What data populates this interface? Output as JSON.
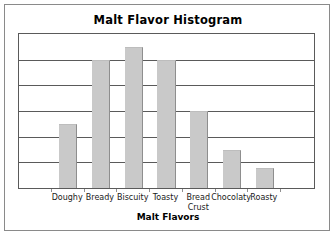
{
  "chart_data": {
    "type": "bar",
    "title": "Malt Flavor Histogram",
    "xlabel": "Malt Flavors",
    "ylabel": "",
    "categories": [
      "Doughy",
      "Bready",
      "Biscuity",
      "Toasty",
      "Bread Crust",
      "Chocolaty",
      "Roasty"
    ],
    "values": [
      2.5,
      5.0,
      5.5,
      5.0,
      3.0,
      1.5,
      0.77
    ],
    "ylim": [
      0,
      6
    ],
    "yticks": [
      0,
      1,
      2,
      3,
      4,
      5,
      6
    ],
    "ytick_labels": [
      "",
      "",
      "",
      "",
      "",
      "",
      ""
    ],
    "grid": true,
    "grid_axis": "y",
    "legend": false,
    "legend_position": "none",
    "bar_color": "#c9c9c9",
    "bar_edge_color": "#8e8e8e",
    "axis_color": "#5a5a5a",
    "plot_background": "#ffffff",
    "n_slots": 9,
    "bar_slot_indices": [
      1,
      2,
      3,
      4,
      5,
      6,
      7
    ]
  },
  "category_label_lines": [
    [
      "Doughy"
    ],
    [
      "Bready"
    ],
    [
      "Biscuity"
    ],
    [
      "Toasty"
    ],
    [
      "Bread",
      "Crust"
    ],
    [
      "Chocolaty"
    ],
    [
      "Roasty"
    ]
  ],
  "frame": {
    "border_color": "#8a8a8a",
    "background": "#ffffff"
  }
}
